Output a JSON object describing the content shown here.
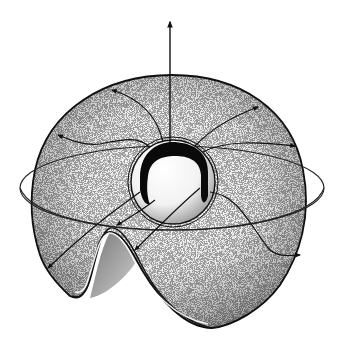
{
  "figure": {
    "type": "illustration",
    "colors": {
      "background": "#ffffff",
      "ink": "#111111",
      "shade_dark": "#6a6a6a",
      "shade_mid": "#a8a8a8",
      "shade_light": "#d9d9d9"
    },
    "elements": [
      {
        "name": "vertical-axis-arrow",
        "direction": "up"
      },
      {
        "name": "outer-shell"
      },
      {
        "name": "central-sphere"
      },
      {
        "name": "black-crescent-band"
      },
      {
        "name": "equatorial-ellipse-ring"
      },
      {
        "name": "field-lines",
        "count": 8,
        "arrowheads": "outward to shell edge"
      },
      {
        "name": "folded-lip",
        "position": "lower-left"
      }
    ]
  }
}
